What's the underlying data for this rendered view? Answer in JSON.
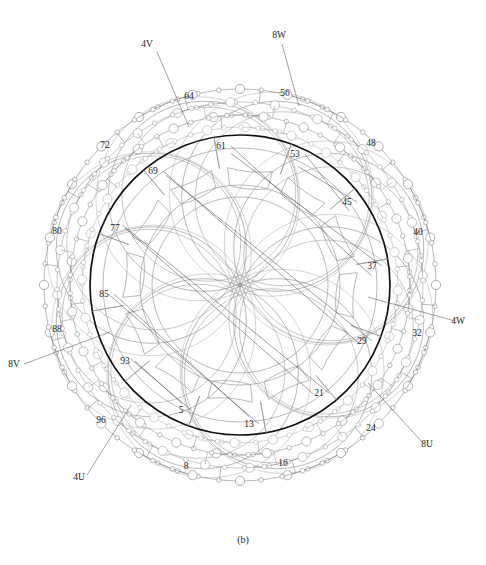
{
  "figure": {
    "caption": "(b)",
    "center": {
      "x": 240,
      "y": 285
    },
    "geometry": {
      "core_outer_radius": 150,
      "core_ring_radius": 137,
      "slot_base_radius": 118,
      "yoke_inner_radius": 100,
      "bore_radius": 88,
      "lobe_count": 8,
      "lobe_radius": 95,
      "lobe_center_distance": 96,
      "chain_radii": [
        158,
        170,
        183,
        196
      ]
    },
    "colors": {
      "core_bold": "#111111",
      "core_thin": "#8d8d8d",
      "winding_gray": "#7f7f7f",
      "winding_light": "#b4b4b4",
      "winding_mid": "#9a9a9a",
      "leader": "#555555",
      "label_text": "#1d1d1d",
      "background": "#ffffff"
    }
  },
  "slot_labels": [
    {
      "text": "5",
      "x": 181,
      "y": 413,
      "angle_deg": 245
    },
    {
      "text": "13",
      "x": 249,
      "y": 427,
      "angle_deg": 275
    },
    {
      "text": "21",
      "x": 319,
      "y": 396,
      "angle_deg": 306
    },
    {
      "text": "29",
      "x": 362,
      "y": 344,
      "angle_deg": 335
    },
    {
      "text": "37",
      "x": 372,
      "y": 269,
      "angle_deg": 5
    },
    {
      "text": "45",
      "x": 347,
      "y": 205,
      "angle_deg": 35
    },
    {
      "text": "53",
      "x": 295,
      "y": 157,
      "angle_deg": 65
    },
    {
      "text": "61",
      "x": 221,
      "y": 149,
      "angle_deg": 95
    },
    {
      "text": "69",
      "x": 153,
      "y": 174,
      "angle_deg": 125
    },
    {
      "text": "77",
      "x": 115,
      "y": 231,
      "angle_deg": 155
    },
    {
      "text": "85",
      "x": 104,
      "y": 297,
      "angle_deg": 185
    },
    {
      "text": "93",
      "x": 125,
      "y": 364,
      "angle_deg": 215
    }
  ],
  "coil_labels": [
    {
      "text": "8",
      "x": 186,
      "y": 469,
      "angle_deg": 258
    },
    {
      "text": "16",
      "x": 283,
      "y": 466,
      "angle_deg": 288
    },
    {
      "text": "24",
      "x": 371,
      "y": 431,
      "angle_deg": 318
    },
    {
      "text": "32",
      "x": 417,
      "y": 336,
      "angle_deg": 348
    },
    {
      "text": "40",
      "x": 418,
      "y": 235,
      "angle_deg": 18
    },
    {
      "text": "48",
      "x": 371,
      "y": 146,
      "angle_deg": 48
    },
    {
      "text": "56",
      "x": 285,
      "y": 96,
      "angle_deg": 78
    },
    {
      "text": "64",
      "x": 189,
      "y": 99,
      "angle_deg": 108
    },
    {
      "text": "72",
      "x": 105,
      "y": 148,
      "angle_deg": 138
    },
    {
      "text": "80",
      "x": 57,
      "y": 234,
      "angle_deg": 168
    },
    {
      "text": "88",
      "x": 57,
      "y": 332,
      "angle_deg": 198
    },
    {
      "text": "96",
      "x": 101,
      "y": 423,
      "angle_deg": 228
    }
  ],
  "terminal_labels": [
    {
      "text": "4V",
      "x": 147,
      "y": 47,
      "leader": [
        [
          157,
          52
        ],
        [
          189,
          127
        ]
      ]
    },
    {
      "text": "8W",
      "x": 279,
      "y": 38,
      "leader": [
        [
          282,
          44
        ],
        [
          299,
          106
        ]
      ]
    },
    {
      "text": "4W",
      "x": 458,
      "y": 324,
      "leader": [
        [
          455,
          321
        ],
        [
          368,
          297
        ]
      ]
    },
    {
      "text": "8U",
      "x": 427,
      "y": 447,
      "leader": [
        [
          423,
          443
        ],
        [
          368,
          383
        ]
      ]
    },
    {
      "text": "4U",
      "x": 79,
      "y": 480,
      "leader": [
        [
          87,
          475
        ],
        [
          131,
          405
        ]
      ]
    },
    {
      "text": "8V",
      "x": 14,
      "y": 367,
      "leader": [
        [
          24,
          364
        ],
        [
          110,
          332
        ]
      ]
    }
  ],
  "slot_count": 96,
  "windings": [
    {
      "name": "phase-U-outer",
      "color": "#7f7f7f",
      "radius": 196
    },
    {
      "name": "phase-V-outer",
      "color": "#9a9a9a",
      "radius": 183
    },
    {
      "name": "phase-W-inner",
      "color": "#8a8a8a",
      "radius": 170
    },
    {
      "name": "phase-X-inner",
      "color": "#b0b0b0",
      "radius": 158
    }
  ]
}
